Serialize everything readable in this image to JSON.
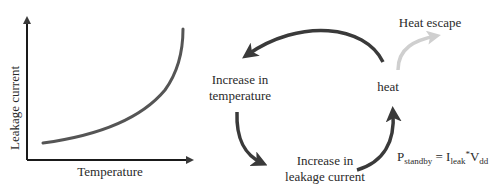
{
  "graph": {
    "ylabel": "Leakage current",
    "xlabel": "Temperature"
  },
  "cycle": {
    "node_temperature": [
      "Increase in",
      "temperature"
    ],
    "node_leakage": [
      "Increase in",
      "leakage current"
    ],
    "node_heat": "heat",
    "heat_escape": "Heat escape",
    "formula": {
      "P": "P",
      "P_sub": "standby",
      "eq": " = ",
      "I": "I",
      "I_sub": "leak",
      "star": "*",
      "V": "V",
      "V_sub": "dd"
    }
  },
  "colors": {
    "dark": "#3a3a3a",
    "light_arrow": "#cfcfcf"
  }
}
